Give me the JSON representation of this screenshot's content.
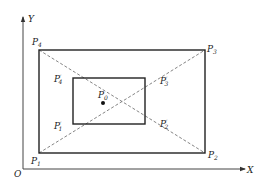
{
  "diagram": {
    "axes": {
      "x_label": "X",
      "y_label": "Y",
      "origin_label": "O"
    },
    "outer_rectangle": {
      "corners": [
        {
          "name": "P",
          "sub": "1",
          "prime": ""
        },
        {
          "name": "P",
          "sub": "2",
          "prime": ""
        },
        {
          "name": "P",
          "sub": "3",
          "prime": ""
        },
        {
          "name": "P",
          "sub": "4",
          "prime": ""
        }
      ]
    },
    "inner_rectangle": {
      "corners": [
        {
          "name": "P",
          "sub": "1",
          "prime": "′"
        },
        {
          "name": "P",
          "sub": "2",
          "prime": "′"
        },
        {
          "name": "P",
          "sub": "3",
          "prime": "′"
        },
        {
          "name": "P",
          "sub": "4",
          "prime": "′"
        }
      ]
    },
    "center": {
      "name": "P",
      "sub": "0"
    },
    "colors": {
      "line": "#222222",
      "dashed": "#666666",
      "background": "#ffffff"
    }
  }
}
